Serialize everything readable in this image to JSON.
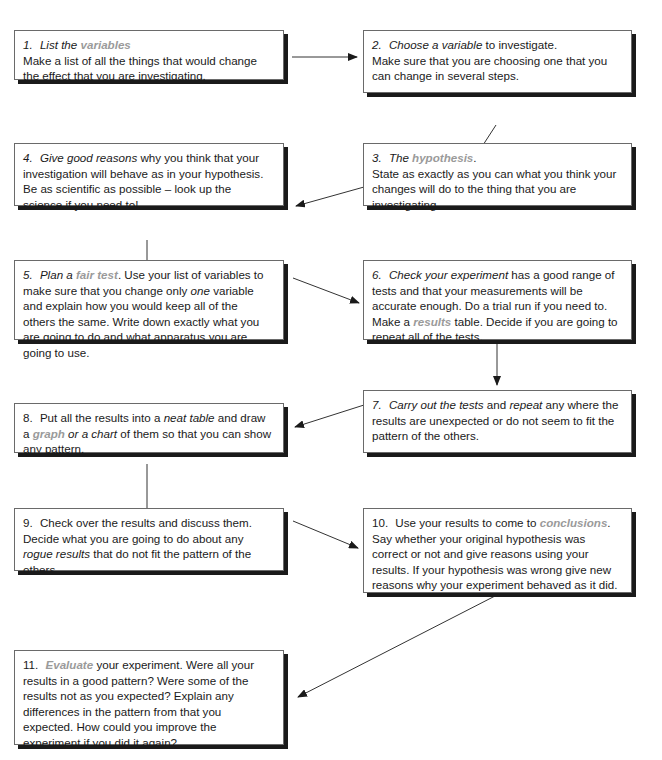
{
  "diagram": {
    "type": "flowchart",
    "highlight_color": "#9a9a9a",
    "steps": [
      {
        "n": "1.",
        "parts": [
          {
            "t": "List the ",
            "s": "it"
          },
          {
            "t": "variables",
            "s": "hl"
          },
          {
            "t": "\nMake a list of all the things that would change the effect that you are investigating.",
            "s": ""
          }
        ]
      },
      {
        "n": "2.",
        "parts": [
          {
            "t": "Choose a variable",
            "s": "it"
          },
          {
            "t": " to investigate.\nMake sure that you are choosing one that you can change in several steps.",
            "s": ""
          }
        ]
      },
      {
        "n": "3.",
        "parts": [
          {
            "t": "The ",
            "s": "it"
          },
          {
            "t": "hypothesis",
            "s": "hl"
          },
          {
            "t": ".\nState as exactly as you can what you think your changes will do to the thing that you are investigating.",
            "s": ""
          }
        ]
      },
      {
        "n": "4.",
        "parts": [
          {
            "t": "Give good reasons",
            "s": "it"
          },
          {
            "t": " why you think that your investigation will behave as in your hypothesis. Be as scientific as possible – look up the science if you need to!",
            "s": ""
          }
        ]
      },
      {
        "n": "5.",
        "parts": [
          {
            "t": "Plan a ",
            "s": "it"
          },
          {
            "t": "fair test",
            "s": "hl"
          },
          {
            "t": ". Use your list of variables to make sure that you change only ",
            "s": ""
          },
          {
            "t": "one",
            "s": "it"
          },
          {
            "t": " variable and explain how you would keep all of the others the same. Write down exactly what you are going to do and what apparatus you are going to use.",
            "s": ""
          }
        ]
      },
      {
        "n": "6.",
        "parts": [
          {
            "t": "Check your experiment",
            "s": "it"
          },
          {
            "t": " has a good range of tests and that your measurements will be accurate enough. Do a trial run if you need to. Make a ",
            "s": ""
          },
          {
            "t": "results",
            "s": "hl"
          },
          {
            "t": " table. Decide if you are going to repeat all of the tests.",
            "s": ""
          }
        ]
      },
      {
        "n": "7.",
        "parts": [
          {
            "t": "Carry out the tests",
            "s": "it"
          },
          {
            "t": " and ",
            "s": ""
          },
          {
            "t": "repeat",
            "s": "it"
          },
          {
            "t": " any where the results are unexpected or do not seem to fit the pattern of the others.",
            "s": ""
          }
        ]
      },
      {
        "n": "8.",
        "parts": [
          {
            "t": "Put all the results into a ",
            "s": ""
          },
          {
            "t": "neat table",
            "s": "it"
          },
          {
            "t": " and draw a ",
            "s": ""
          },
          {
            "t": "graph",
            "s": "hl"
          },
          {
            "t": " or a chart",
            "s": "it"
          },
          {
            "t": " of them so that you can show any pattern.",
            "s": ""
          }
        ]
      },
      {
        "n": "9.",
        "parts": [
          {
            "t": "Check over the results and discuss them. Decide what you are going to do about any ",
            "s": ""
          },
          {
            "t": "rogue results",
            "s": "it"
          },
          {
            "t": " that do not fit the pattern of the others.",
            "s": ""
          }
        ]
      },
      {
        "n": "10.",
        "parts": [
          {
            "t": "Use your results to come to ",
            "s": ""
          },
          {
            "t": "conclusions",
            "s": "hl"
          },
          {
            "t": ". Say whether your original hypothesis was correct or not and give reasons using your results. If your hypothesis was wrong give new reasons why your experiment behaved as it did.",
            "s": ""
          }
        ]
      },
      {
        "n": "11.",
        "parts": [
          {
            "t": "Evaluate",
            "s": "hl"
          },
          {
            "t": " your experiment. Were all your results in a good pattern? Were some of the results not as you expected? Explain any differences in the pattern from that you expected. How could you improve the experiment if you did it again?",
            "s": ""
          }
        ]
      }
    ],
    "edges": [
      [
        "1",
        "2"
      ],
      [
        "2",
        "3"
      ],
      [
        "3",
        "4"
      ],
      [
        "4",
        "5"
      ],
      [
        "5",
        "6"
      ],
      [
        "6",
        "7"
      ],
      [
        "7",
        "8"
      ],
      [
        "8",
        "9"
      ],
      [
        "9",
        "10"
      ],
      [
        "10",
        "11"
      ]
    ]
  }
}
